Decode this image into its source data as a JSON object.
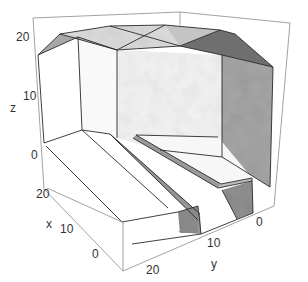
{
  "figure": {
    "type": "3d-polyhedral-surface",
    "colors": {
      "background": "#ffffff",
      "box": "#8a8a8a",
      "edge": "#2a2a2a",
      "face_light": "#f3f3f3",
      "face_top": "#d9d9d9",
      "face_mid": "#b5b5b5",
      "face_dark": "#8e8e8e",
      "face_darker": "#777777"
    }
  },
  "axes": {
    "z": {
      "label": "z",
      "ticks": [
        "0",
        "10",
        "20"
      ]
    },
    "x": {
      "label": "x",
      "ticks": [
        "0",
        "10",
        "20"
      ]
    },
    "y": {
      "label": "y",
      "ticks": [
        "0",
        "10",
        "20"
      ]
    }
  }
}
